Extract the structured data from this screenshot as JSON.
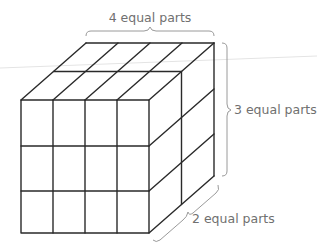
{
  "diagram": {
    "type": "rectangular prism divided into equal parts",
    "labels": {
      "width": "4 equal parts",
      "height": "3 equal parts",
      "depth": "2 equal parts"
    },
    "divisions": {
      "columns": 4,
      "rows": 3,
      "depth": 2
    },
    "colors": {
      "edges": "#2a2a2a",
      "labels": "#707070",
      "braces": "#9a9a9a",
      "background": "#ffffff"
    }
  }
}
